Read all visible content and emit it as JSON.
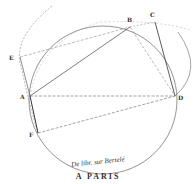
{
  "diagram": {
    "points": {
      "A": {
        "label": "A",
        "x": 30,
        "y": 96
      },
      "B": {
        "label": "B",
        "x": 130,
        "y": 27
      },
      "C": {
        "label": "C",
        "x": 155,
        "y": 22
      },
      "D": {
        "label": "D",
        "x": 175,
        "y": 96
      },
      "E": {
        "label": "E",
        "x": 20,
        "y": 57
      },
      "F": {
        "label": "F",
        "x": 38,
        "y": 133
      }
    },
    "stroke_color": "#555555"
  },
  "caption": {
    "line1": "De libr. sur Bertelé",
    "line2": "A PARIS"
  }
}
